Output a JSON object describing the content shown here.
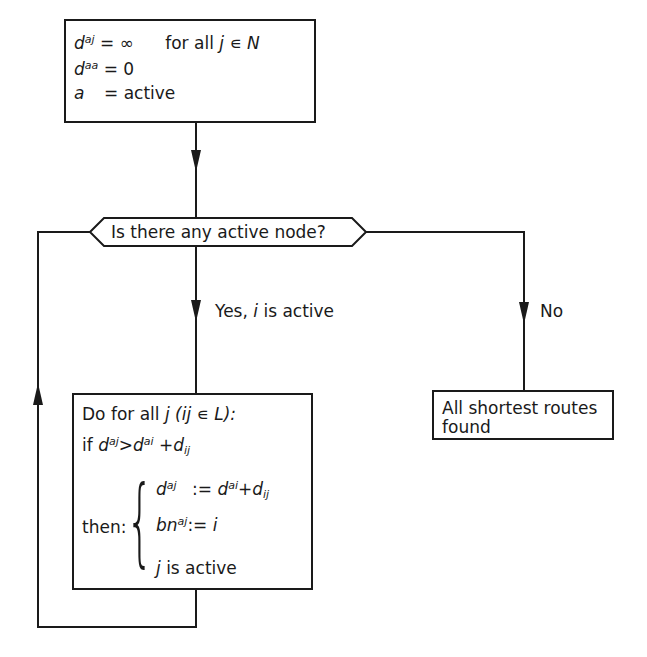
{
  "init_box": {
    "line1": {
      "var": "d",
      "sup": "aj",
      "rhs": "= ∞",
      "condition": "for all",
      "j": "j",
      "elem": "∊",
      "set": "N"
    },
    "line2": {
      "var": "d",
      "sup": "aa",
      "rhs": "= 0"
    },
    "line3": {
      "var": "a",
      "rhs": "= active"
    }
  },
  "decision": {
    "label": "Is there any active node?"
  },
  "branches": {
    "yes": {
      "label_pre": "Yes,",
      "var": "i",
      "label_post": "is active"
    },
    "no": {
      "label": "No"
    }
  },
  "loop_box": {
    "line1": {
      "pre": "Do for all",
      "j": "j",
      "cond": "(ij ∊ L):"
    },
    "line2": {
      "if": "if",
      "lhs": "d",
      "lhs_sup": "aj",
      "op": ">",
      "rhs1": "d",
      "rhs1_sup": "ai",
      "plus": "+",
      "rhs2": "d",
      "rhs2_sub": "ij"
    },
    "then_label": "then:",
    "stmt1": {
      "lhs": "d",
      "lhs_sup": "aj",
      "assign": ":=",
      "rhs1": "d",
      "rhs1_sup": "ai",
      "plus": "+",
      "rhs2": "d",
      "rhs2_sub": "ij"
    },
    "stmt2": {
      "lhs": "bn",
      "lhs_sup": "aj",
      "assign": ":=",
      "rhs": "i"
    },
    "stmt3": {
      "var": "j",
      "text": "is active"
    },
    "brace": "{"
  },
  "end_box": {
    "line1": "All shortest routes",
    "line2": "found"
  },
  "colors": {
    "ink": "#1a1a1a",
    "background": "#ffffff"
  }
}
